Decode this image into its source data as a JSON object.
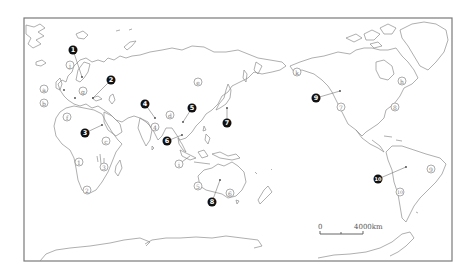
{
  "map": {
    "title": "",
    "projection": "world map centered on Pacific",
    "scale_bar": {
      "zero_label": "0",
      "distance_label": "4000km"
    },
    "solid_markers": [
      {
        "id": "1",
        "label": "1",
        "x": 73,
        "y": 50,
        "point": [
          82,
          77
        ]
      },
      {
        "id": "2",
        "label": "2",
        "x": 111,
        "y": 80,
        "point": [
          93,
          98
        ]
      },
      {
        "id": "3",
        "label": "3",
        "x": 85,
        "y": 133,
        "point": [
          102,
          125
        ]
      },
      {
        "id": "4",
        "label": "4",
        "x": 145,
        "y": 104,
        "point": [
          155,
          118
        ]
      },
      {
        "id": "5",
        "label": "5",
        "x": 192,
        "y": 108,
        "point": [
          183,
          122
        ]
      },
      {
        "id": "6",
        "label": "6",
        "x": 167,
        "y": 141,
        "point": [
          182,
          135
        ]
      },
      {
        "id": "7",
        "label": "7",
        "x": 227,
        "y": 123,
        "point": [
          227,
          108
        ]
      },
      {
        "id": "8",
        "label": "8",
        "x": 212,
        "y": 202,
        "point": [
          220,
          180
        ]
      },
      {
        "id": "9",
        "label": "9",
        "x": 316,
        "y": 98,
        "point": [
          340,
          91
        ]
      },
      {
        "id": "10",
        "label": "10",
        "x": 378,
        "y": 179,
        "point": [
          406,
          167
        ]
      }
    ],
    "open_markers_letters": [
      {
        "id": "a",
        "label": "a",
        "x": 44,
        "y": 89
      },
      {
        "id": "b",
        "label": "b",
        "x": 44,
        "y": 103
      },
      {
        "id": "c",
        "label": "c",
        "x": 106,
        "y": 141
      },
      {
        "id": "d",
        "label": "d",
        "x": 170,
        "y": 115
      },
      {
        "id": "e",
        "label": "e",
        "x": 198,
        "y": 82
      },
      {
        "id": "f",
        "label": "f",
        "x": 67,
        "y": 117
      },
      {
        "id": "g",
        "label": "g",
        "x": 83,
        "y": 91
      },
      {
        "id": "h",
        "label": "h",
        "x": 402,
        "y": 81
      },
      {
        "id": "i",
        "label": "i",
        "x": 179,
        "y": 164
      },
      {
        "id": "k",
        "label": "k",
        "x": 297,
        "y": 72
      },
      {
        "id": "j",
        "label": "j",
        "x": 70,
        "y": 65
      }
    ],
    "open_markers_numbers": [
      {
        "id": "1",
        "label": "1",
        "x": 79,
        "y": 162
      },
      {
        "id": "2",
        "label": "2",
        "x": 87,
        "y": 190
      },
      {
        "id": "3",
        "label": "3",
        "x": 104,
        "y": 167
      },
      {
        "id": "4",
        "label": "4",
        "x": 155,
        "y": 127
      },
      {
        "id": "5",
        "label": "5",
        "x": 198,
        "y": 186
      },
      {
        "id": "6",
        "label": "6",
        "x": 230,
        "y": 193
      },
      {
        "id": "7",
        "label": "7",
        "x": 341,
        "y": 107
      },
      {
        "id": "8",
        "label": "8",
        "x": 395,
        "y": 107
      },
      {
        "id": "9",
        "label": "9",
        "x": 431,
        "y": 169
      },
      {
        "id": "10",
        "label": "10",
        "x": 400,
        "y": 192
      }
    ]
  }
}
